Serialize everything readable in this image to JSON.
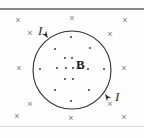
{
  "figure": {
    "type": "physics-diagram",
    "width": 144,
    "height": 138,
    "background_color": "#fefefe"
  },
  "rules": {
    "top": {
      "name": "top-divider",
      "color": "#8a8a8a",
      "y": 8,
      "thickness": 2
    },
    "bottom": {
      "name": "bottom-divider",
      "color": "#d8d8d8",
      "y": 126,
      "thickness": 1
    }
  },
  "loop": {
    "label": "current-loop",
    "cx": 72,
    "cy": 70,
    "r": 39,
    "stroke_color": "#2e2e2e",
    "stroke_width": 1.1
  },
  "arrows": [
    {
      "name": "current-arrow-upper-left",
      "x": 48,
      "y": 38,
      "angle": 55
    },
    {
      "name": "current-arrow-lower-right",
      "x": 105,
      "y": 94,
      "angle": 235
    }
  ],
  "labels": {
    "field_symbol": "B",
    "field_symbol_x": 76,
    "field_symbol_y": 58,
    "current_symbol": "I",
    "current_labels": [
      {
        "text": "I",
        "x": 38,
        "y": 24
      },
      {
        "text": "I",
        "x": 115,
        "y": 90
      }
    ]
  },
  "field_into_page": {
    "symbol": "×",
    "color": "#7d7d7d",
    "marks": [
      {
        "x": 18,
        "y": 20
      },
      {
        "x": 72,
        "y": 18
      },
      {
        "x": 125,
        "y": 20
      },
      {
        "x": 30,
        "y": 33
      },
      {
        "x": 110,
        "y": 34
      },
      {
        "x": 19,
        "y": 68
      },
      {
        "x": 124,
        "y": 68
      },
      {
        "x": 30,
        "y": 104
      },
      {
        "x": 110,
        "y": 104
      },
      {
        "x": 17,
        "y": 116
      },
      {
        "x": 71,
        "y": 118
      },
      {
        "x": 124,
        "y": 117
      }
    ]
  },
  "field_out_of_page": {
    "symbol": "•",
    "color": "#3a3a3a",
    "dots": [
      {
        "x": 71,
        "y": 37
      },
      {
        "x": 55,
        "y": 49
      },
      {
        "x": 90,
        "y": 48
      },
      {
        "x": 65,
        "y": 58
      },
      {
        "x": 72,
        "y": 58
      },
      {
        "x": 40,
        "y": 69
      },
      {
        "x": 57,
        "y": 68
      },
      {
        "x": 66,
        "y": 68
      },
      {
        "x": 73,
        "y": 68
      },
      {
        "x": 80,
        "y": 68
      },
      {
        "x": 88,
        "y": 69
      },
      {
        "x": 104,
        "y": 69
      },
      {
        "x": 65,
        "y": 79
      },
      {
        "x": 73,
        "y": 79
      },
      {
        "x": 55,
        "y": 90
      },
      {
        "x": 89,
        "y": 90
      },
      {
        "x": 71,
        "y": 101
      }
    ]
  }
}
